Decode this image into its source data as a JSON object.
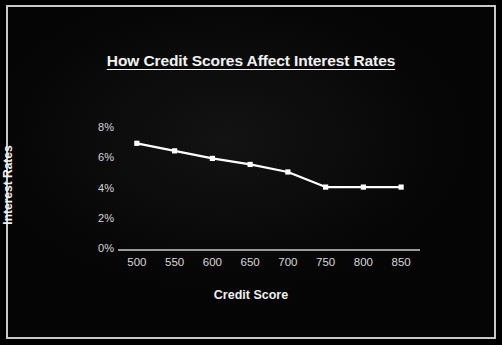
{
  "chart_data": {
    "type": "line",
    "title": "How Credit Scores Affect Interest Rates",
    "xlabel": "Credit Score",
    "ylabel": "Interest Rates",
    "x": [
      500,
      550,
      600,
      650,
      700,
      750,
      800,
      850
    ],
    "categories": [
      "500",
      "550",
      "600",
      "650",
      "700",
      "750",
      "800",
      "850"
    ],
    "values": [
      7.0,
      6.5,
      6.0,
      5.6,
      5.1,
      4.1,
      4.1,
      4.1
    ],
    "series": [
      {
        "name": "Interest Rates",
        "values": [
          7.0,
          6.5,
          6.0,
          5.6,
          5.1,
          4.1,
          4.1,
          4.1
        ],
        "color": "#ffffff",
        "marker": "square"
      }
    ],
    "xlim": [
      475,
      875
    ],
    "ylim": [
      0,
      8
    ],
    "x_ticks": [
      500,
      550,
      600,
      650,
      700,
      750,
      800,
      850
    ],
    "x_tick_labels": [
      "500",
      "550",
      "600",
      "650",
      "700",
      "750",
      "800",
      "850"
    ],
    "y_ticks": [
      0,
      2,
      4,
      6,
      8
    ],
    "y_tick_labels": [
      "0%",
      "2%",
      "4%",
      "6%",
      "8%"
    ],
    "grid": false,
    "legend": false,
    "legend_position": "none",
    "background_color": "#000000",
    "foreground_color": "#ffffff",
    "title_underlined": true
  }
}
